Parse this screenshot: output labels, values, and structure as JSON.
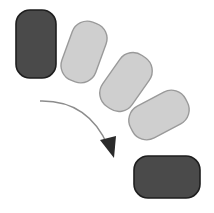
{
  "diagram": {
    "type": "rotation-sequence",
    "background": "#ffffff",
    "colors": {
      "dark_fill": "#4a4a4a",
      "dark_stroke": "#1e1e1e",
      "light_fill": "#cfcfcf",
      "light_stroke": "#9a9a9a",
      "arrow_line": "#8c8c8c",
      "arrow_head": "#2a2a2a"
    },
    "shapes": [
      {
        "id": "start",
        "role": "initial-position",
        "style": "dark",
        "cx": 36,
        "cy": 44,
        "w": 40,
        "h": 68,
        "rx": 14,
        "rotate": 0
      },
      {
        "id": "step-1",
        "role": "intermediate-position",
        "style": "light",
        "cx": 84,
        "cy": 52,
        "w": 36,
        "h": 62,
        "rx": 16,
        "rotate": 20
      },
      {
        "id": "step-2",
        "role": "intermediate-position",
        "style": "light",
        "cx": 126,
        "cy": 82,
        "w": 36,
        "h": 62,
        "rx": 16,
        "rotate": 35
      },
      {
        "id": "step-3",
        "role": "intermediate-position",
        "style": "light",
        "cx": 159,
        "cy": 115,
        "w": 36,
        "h": 62,
        "rx": 16,
        "rotate": 62
      },
      {
        "id": "end",
        "role": "final-position",
        "style": "dark",
        "cx": 167,
        "cy": 177,
        "w": 66,
        "h": 42,
        "rx": 14,
        "rotate": 0
      }
    ],
    "arrow": {
      "direction": "clockwise",
      "path": "M40 101 Q 88 100 108 146",
      "head_points": "100,140 116,136 114,158"
    }
  }
}
